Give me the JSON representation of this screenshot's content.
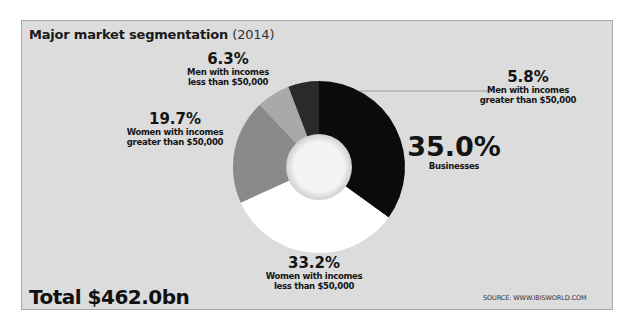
{
  "chart_data": {
    "type": "pie",
    "subtype": "donut",
    "title": "Major market segmentation (2014)",
    "title_main": "Major market segmentation",
    "title_year": "(2014)",
    "unit": "%",
    "total": "Total $462.0bn",
    "source": "SOURCE: WWW.IBISWORLD.COM",
    "segments": [
      {
        "label": "Businesses",
        "value": 35.0,
        "pct_text": "35.0%",
        "color": "#0b0b0b"
      },
      {
        "label": "Women with incomes less than $50,000",
        "value": 33.2,
        "pct_text": "33.2%",
        "color": "#ffffff"
      },
      {
        "label": "Women with incomes greater than $50,000",
        "value": 19.7,
        "pct_text": "19.7%",
        "color": "#8a8a8a"
      },
      {
        "label": "Men with incomes less than $50,000",
        "value": 6.3,
        "pct_text": "6.3%",
        "color": "#a9a9a9"
      },
      {
        "label": "Men with incomes greater than $50,000",
        "value": 5.8,
        "pct_text": "5.8%",
        "color": "#2a2a2a"
      }
    ],
    "labels": {
      "businesses": {
        "pct": "35.0%",
        "line1": "Businesses"
      },
      "women_lt": {
        "pct": "33.2%",
        "line1": "Women with incomes",
        "line2": "less than $50,000"
      },
      "women_gt": {
        "pct": "19.7%",
        "line1": "Women with incomes",
        "line2": "greater than $50,000"
      },
      "men_lt": {
        "pct": "6.3%",
        "line1": "Men with incomes",
        "line2": "less than $50,000"
      },
      "men_gt": {
        "pct": "5.8%",
        "line1": "Men with incomes",
        "line2": "greater than $50,000"
      }
    },
    "legend": "none (direct labels)"
  }
}
